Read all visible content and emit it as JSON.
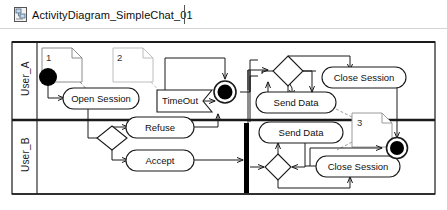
{
  "tab": {
    "label": "ActivityDiagram_SimpleChat_01",
    "icon": "diagram-file-icon"
  },
  "diagram": {
    "type": "uml-activity-diagram",
    "lanes": [
      {
        "id": "lane-a",
        "label": "User_A"
      },
      {
        "id": "lane-b",
        "label": "User_B"
      }
    ],
    "notes": [
      {
        "id": "note-1",
        "label": "1"
      },
      {
        "id": "note-2",
        "label": "2"
      },
      {
        "id": "note-3",
        "label": "3"
      }
    ],
    "nodes": {
      "lane_a": {
        "initial_node": "initial-node",
        "open_session": "Open Session",
        "timeout": "TimeOut",
        "final_node": "activity-final-node",
        "decision": "decision-node",
        "send_data": "Send Data",
        "close_session": "Close Session"
      },
      "lane_b": {
        "decision": "decision-node",
        "refuse": "Refuse",
        "accept": "Accept",
        "sync_bar": "synchronization-bar",
        "send_data": "Send Data",
        "decision2": "decision-node",
        "close_session": "Close Session",
        "final_node": "activity-final-node"
      }
    },
    "colors": {
      "stroke": "#1a1a1a",
      "note_stroke": "#9a9a9a",
      "fill": "#ffffff",
      "solid": "#000000"
    }
  }
}
